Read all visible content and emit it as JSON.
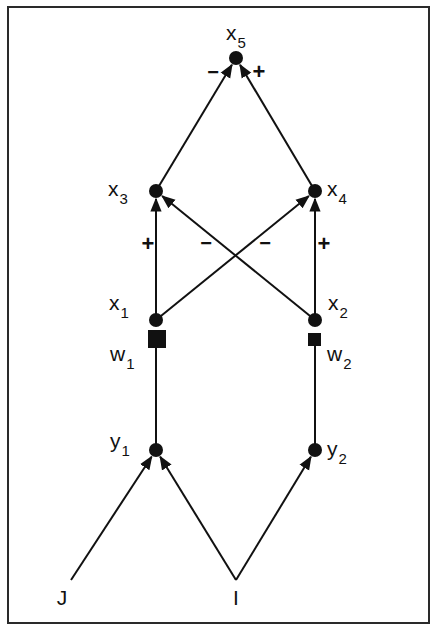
{
  "figure": {
    "colors": {
      "ink": "#111111",
      "background": "#ffffff",
      "frame": "#2a2a2a"
    },
    "frame": {
      "left": 8,
      "top": 7,
      "right": 429,
      "bottom": 623
    },
    "nodes": [
      {
        "id": "x5",
        "base": "x",
        "sub": "5",
        "cx": 236,
        "cy": 58,
        "shape": "circle",
        "label_x": 226,
        "label_y": 40,
        "label_anchor": "start"
      },
      {
        "id": "x3",
        "base": "x",
        "sub": "3",
        "cx": 156,
        "cy": 191,
        "shape": "circle",
        "label_x": 108,
        "label_y": 196,
        "label_anchor": "start"
      },
      {
        "id": "x4",
        "base": "x",
        "sub": "4",
        "cx": 315,
        "cy": 191,
        "shape": "circle",
        "label_x": 327,
        "label_y": 196,
        "label_anchor": "start"
      },
      {
        "id": "x1",
        "base": "x",
        "sub": "1",
        "cx": 156,
        "cy": 320,
        "shape": "circle",
        "label_x": 109,
        "label_y": 310,
        "label_anchor": "start"
      },
      {
        "id": "x2",
        "base": "x",
        "sub": "2",
        "cx": 315,
        "cy": 320,
        "shape": "circle",
        "label_x": 328,
        "label_y": 310,
        "label_anchor": "start"
      },
      {
        "id": "y1",
        "base": "y",
        "sub": "1",
        "cx": 156,
        "cy": 450,
        "shape": "circle",
        "label_x": 110,
        "label_y": 448,
        "label_anchor": "start"
      },
      {
        "id": "y2",
        "base": "y",
        "sub": "2",
        "cx": 315,
        "cy": 450,
        "shape": "circle",
        "label_x": 327,
        "label_y": 456,
        "label_anchor": "start"
      }
    ],
    "weights": [
      {
        "id": "w1",
        "base": "w",
        "sub": "1",
        "x": 148,
        "y": 330,
        "size": 18,
        "label_x": 110,
        "label_y": 361
      },
      {
        "id": "w2",
        "base": "w",
        "sub": "2",
        "x": 308,
        "y": 333,
        "size": 13,
        "label_x": 327,
        "label_y": 361
      }
    ],
    "inputs": [
      {
        "id": "J",
        "label": "J",
        "x": 62,
        "y": 605
      },
      {
        "id": "I",
        "label": "I",
        "x": 236,
        "y": 605
      }
    ],
    "edges": [
      {
        "from": "x3",
        "to": "x5",
        "x1": 156,
        "y1": 191,
        "x2": 236,
        "y2": 58,
        "sign": "−",
        "sign_x": 213,
        "sign_y": 79
      },
      {
        "from": "x4",
        "to": "x5",
        "x1": 315,
        "y1": 191,
        "x2": 236,
        "y2": 58,
        "sign": "+",
        "sign_x": 259,
        "sign_y": 79
      },
      {
        "from": "x1",
        "to": "x3",
        "x1": 156,
        "y1": 320,
        "x2": 156,
        "y2": 191,
        "sign": "+",
        "sign_x": 148,
        "sign_y": 251
      },
      {
        "from": "x2",
        "to": "x4",
        "x1": 315,
        "y1": 320,
        "x2": 315,
        "y2": 191,
        "sign": "+",
        "sign_x": 324,
        "sign_y": 251
      },
      {
        "from": "x2",
        "to": "x3",
        "x1": 315,
        "y1": 320,
        "x2": 156,
        "y2": 191,
        "sign": "−",
        "sign_x": 206,
        "sign_y": 250
      },
      {
        "from": "x1",
        "to": "x4",
        "x1": 156,
        "y1": 320,
        "x2": 315,
        "y2": 191,
        "sign": "−",
        "sign_x": 265,
        "sign_y": 250
      },
      {
        "from": "y1",
        "to": "w1",
        "x1": 156,
        "y1": 450,
        "x2": 156,
        "y2": 348,
        "sign": "",
        "arrow": false
      },
      {
        "from": "y2",
        "to": "w2",
        "x1": 315,
        "y1": 450,
        "x2": 315,
        "y2": 346,
        "sign": "",
        "arrow": false
      },
      {
        "from": "J",
        "to": "y1",
        "x1": 71,
        "y1": 580,
        "x2": 156,
        "y2": 450,
        "sign": ""
      },
      {
        "from": "I",
        "to": "y1",
        "x1": 236,
        "y1": 580,
        "x2": 156,
        "y2": 450,
        "sign": ""
      },
      {
        "from": "I",
        "to": "y2",
        "x1": 236,
        "y1": 580,
        "x2": 315,
        "y2": 450,
        "sign": ""
      }
    ]
  }
}
